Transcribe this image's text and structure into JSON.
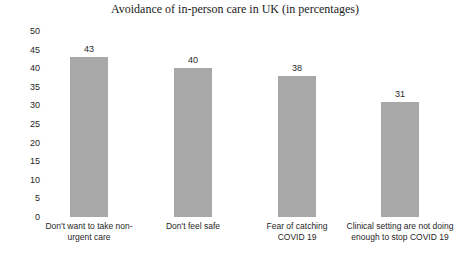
{
  "chart_data": {
    "type": "bar",
    "title": "Avoidance of in-person care in UK (in percentages)",
    "xlabel": "",
    "ylabel": "",
    "ylim": [
      0,
      50
    ],
    "ytick_step": 5,
    "grid": false,
    "legend": false,
    "bar_color": "#a8a8a8",
    "background_color": "#ffffff",
    "categories": [
      "Don't want to take non-urgent care",
      "Don't feel safe",
      "Fear of catching COVID 19",
      "Clinical setting are not doing enough to stop COVID 19"
    ],
    "values": [
      43,
      40,
      38,
      31
    ],
    "value_labels": [
      "43",
      "40",
      "38",
      "31"
    ],
    "ytick_labels": [
      "50",
      "45",
      "40",
      "35",
      "30",
      "25",
      "20",
      "15",
      "10",
      "5",
      "0"
    ]
  }
}
